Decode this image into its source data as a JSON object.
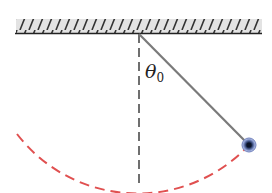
{
  "diagram": {
    "type": "simple-pendulum",
    "angle_label": "θ",
    "angle_subscript": "0",
    "colors": {
      "ceiling_fill": "#e6e6e6",
      "ceiling_hatch": "#333333",
      "string": "#777777",
      "reference_line": "#333333",
      "arc": "#e05050",
      "bob_outer": "#5a6fb0",
      "bob_inner": "#1c2b4a"
    }
  }
}
